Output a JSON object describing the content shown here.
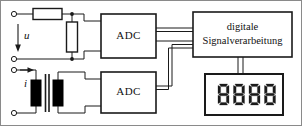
{
  "diagram": {
    "colors": {
      "line": "#1a1a1a",
      "fill_coil": "#000000",
      "background": "#ffffff",
      "border": "#8a8a8a",
      "text": "#111111"
    },
    "inputs": [
      {
        "symbol": "u",
        "name": "voltage-input",
        "terminals": 2
      },
      {
        "symbol": "i",
        "name": "current-input",
        "terminals": 2
      }
    ],
    "blocks": [
      {
        "id": "adc_top",
        "label": "ADC"
      },
      {
        "id": "adc_bottom",
        "label": "ADC"
      },
      {
        "id": "dsp",
        "label_line1": "digitale",
        "label_line2": "Signalverarbeitung"
      }
    ],
    "display": {
      "name": "seven-segment-display",
      "value": "8888",
      "digits": 4
    },
    "components": {
      "series_resistor": "resistor-series",
      "shunt_resistor": "resistor-shunt",
      "current_transformer": "current-transformer"
    }
  }
}
